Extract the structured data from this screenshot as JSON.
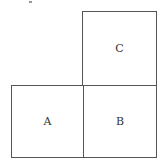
{
  "diagram": {
    "squares": [
      {
        "id": "A",
        "label": "A"
      },
      {
        "id": "B",
        "label": "B"
      },
      {
        "id": "C",
        "label": "C"
      }
    ],
    "line_color": "#555555"
  }
}
